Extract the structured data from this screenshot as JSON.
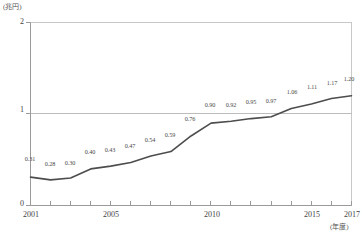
{
  "chart_data": {
    "type": "line",
    "title": "",
    "subtitle": "",
    "xlabel": "(年度)",
    "ylabel": "(兆円)",
    "ylim": [
      0,
      2
    ],
    "yticks": [
      "0",
      "1",
      "2"
    ],
    "ytick_values": [
      0,
      1,
      2
    ],
    "xlim": [
      2001,
      2017
    ],
    "xticks": [
      "2001",
      "2005",
      "2010",
      "2015",
      "2017"
    ],
    "xtick_values": [
      2001,
      2005,
      2010,
      2015,
      2017
    ],
    "grid": "horizontal-single-at-1",
    "legend": "none",
    "x": [
      2001,
      2002,
      2003,
      2004,
      2005,
      2006,
      2007,
      2008,
      2009,
      2010,
      2011,
      2012,
      2013,
      2014,
      2015,
      2016,
      2017
    ],
    "values": [
      0.31,
      0.28,
      0.3,
      0.4,
      0.43,
      0.47,
      0.54,
      0.59,
      0.76,
      0.9,
      0.92,
      0.95,
      0.97,
      1.06,
      1.11,
      1.17,
      1.2
    ],
    "data_labels": [
      "0.31",
      "0.28",
      "0.30",
      "0.40",
      "0.43",
      "0.47",
      "0.54",
      "0.59",
      "0.76",
      "0.90",
      "0.92",
      "0.95",
      "0.97",
      "1.06",
      "1.11",
      "1.17",
      "1.20"
    ],
    "series": [
      {
        "name": "",
        "color": "#4d4d4d",
        "values": [
          0.31,
          0.28,
          0.3,
          0.4,
          0.43,
          0.47,
          0.54,
          0.59,
          0.76,
          0.9,
          0.92,
          0.95,
          0.97,
          1.06,
          1.11,
          1.17,
          1.2
        ]
      }
    ],
    "colors": {
      "line": "#4d4d4d",
      "axis": "#9a9a9a",
      "gridline": "#b9b9b9",
      "text": "#444444",
      "background": "#ffffff"
    }
  }
}
